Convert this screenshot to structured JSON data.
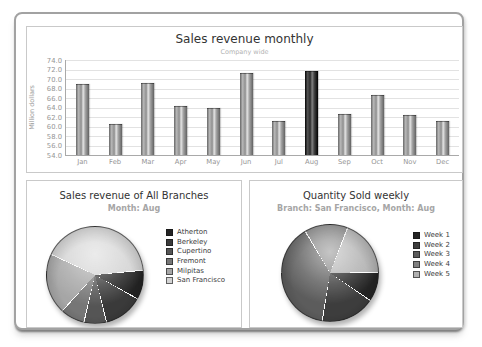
{
  "colors": {
    "frame_border": "#a2a2a2",
    "panel_border": "#c9c9c9",
    "grid": "#e2e2e2",
    "axis": "#a9a9a9",
    "tick_text": "#959595",
    "title_text": "#333333",
    "subtitle_text": "#a6a6a6"
  },
  "chart_data": [
    {
      "type": "bar",
      "title": "Sales revenue monthly",
      "subtitle": "Company wide",
      "ylabel": "Million dollars",
      "ylim": [
        54.0,
        74.0
      ],
      "ytick_step": 2.0,
      "grid": true,
      "categories": [
        "Jan",
        "Feb",
        "Mar",
        "Apr",
        "May",
        "Jun",
        "Jul",
        "Aug",
        "Sep",
        "Oct",
        "Nov",
        "Dec"
      ],
      "values": [
        68.8,
        60.4,
        68.9,
        64.2,
        63.6,
        71.0,
        61.0,
        71.5,
        62.4,
        66.4,
        62.2,
        61.0
      ],
      "highlight_category": "Aug",
      "bar_color": "#9e9e9e",
      "highlight_color": "#3a3a3a"
    },
    {
      "type": "pie",
      "title": "Sales revenue of All Branches",
      "subtitle": "Month: Aug",
      "legend_position": "right",
      "start_angle_deg": -5,
      "slices": [
        {
          "label": "Atherton",
          "color": "#242424",
          "angle_deg": 35,
          "percent": 9.7
        },
        {
          "label": "Berkeley",
          "color": "#3a3a3a",
          "angle_deg": 47,
          "percent": 13.1
        },
        {
          "label": "Cupertino",
          "color": "#555555",
          "angle_deg": 27,
          "percent": 7.5
        },
        {
          "label": "Fremont",
          "color": "#767676",
          "angle_deg": 29,
          "percent": 8.1
        },
        {
          "label": "Milpitas",
          "color": "#a6a6a6",
          "angle_deg": 73,
          "percent": 20.3
        },
        {
          "label": "San Francisco",
          "color": "#d3d3d3",
          "angle_deg": 149,
          "percent": 41.4
        }
      ]
    },
    {
      "type": "pie",
      "title": "Quantity Sold weekly",
      "subtitle": "Branch: San Francisco, Month: Aug",
      "legend_position": "right",
      "start_angle_deg": 0,
      "slices": [
        {
          "label": "Week 1",
          "color": "#242424",
          "angle_deg": 35,
          "percent": 9.7
        },
        {
          "label": "Week 2",
          "color": "#3d3d3d",
          "angle_deg": 65,
          "percent": 18.1
        },
        {
          "label": "Week 3",
          "color": "#5c5c5c",
          "angle_deg": 140,
          "percent": 38.9
        },
        {
          "label": "Week 4",
          "color": "#808080",
          "angle_deg": 52,
          "percent": 14.4
        },
        {
          "label": "Week 5",
          "color": "#b0b0b0",
          "angle_deg": 68,
          "percent": 18.9
        }
      ]
    }
  ]
}
